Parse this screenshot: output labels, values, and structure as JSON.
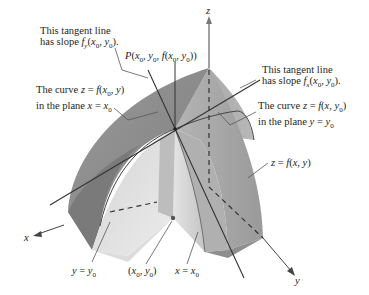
{
  "figure": {
    "type": "3d-surface-partial-derivatives",
    "axes": {
      "x_label": "x",
      "y_label": "y",
      "z_label": "z"
    },
    "labels": {
      "tangent_fy_line1": "This tangent line",
      "tangent_fy_line2": "has slope f_y(x_0, y_0).",
      "point_p": "P(x_0, y_0, f(x_0, y_0))",
      "curve_x0_line1": "The curve z = f(x_0, y)",
      "curve_x0_line2": "in the plane x = x_0",
      "tangent_fx_line1": "This tangent line",
      "tangent_fx_line2": "has slope f_x(x_0, y_0).",
      "curve_y0_line1": "The curve z = f(x, y_0)",
      "curve_y0_line2": "in the plane y = y_0",
      "surface": "z = f(x, y)",
      "plane_y0": "y = y_0",
      "base_point": "(x_0, y_0)",
      "plane_x0": "x = x_0"
    },
    "colors": {
      "surface_dark": "#8c8c8c",
      "surface_mid": "#a8a8a8",
      "surface_light": "#cfcfcf",
      "face_light": "#e2e2e2",
      "line": "#333333",
      "leader": "#555555"
    }
  }
}
